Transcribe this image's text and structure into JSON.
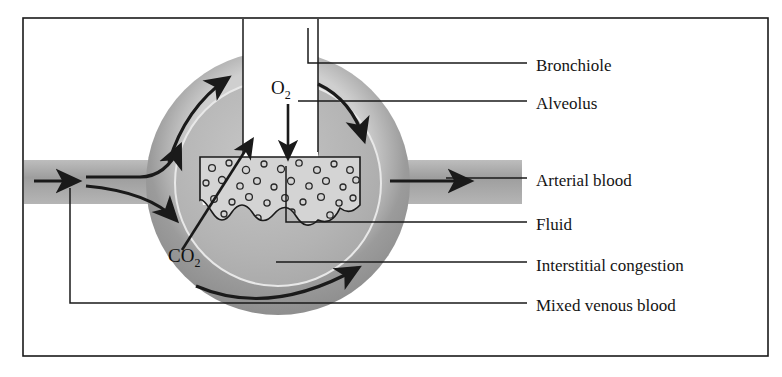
{
  "figure": {
    "kind": "alveolus-capillary-diagram",
    "frame": {
      "x": 23,
      "y": 18,
      "width": 745,
      "height": 338,
      "border_color": "#1a1a1a"
    },
    "background": "#ffffff"
  },
  "colors": {
    "capillary_ring": "#9b9b9b",
    "capillary_ring_dark": "#808080",
    "vessel": "#a6a6a6",
    "alveolus_interior": "#b4b4b4",
    "alveolus_lumen": "#ffffff",
    "fluid": "#d2d2d2",
    "ink": "#141414",
    "bronchiole": "#ffffff"
  },
  "gas_labels": [
    {
      "id": "o2",
      "text": "O",
      "subscript": "2",
      "x": 271,
      "y": 78,
      "arrow": "down"
    },
    {
      "id": "co2",
      "text": "CO",
      "subscript": "2",
      "x": 168,
      "y": 246,
      "arrow": "up-right"
    }
  ],
  "callouts": [
    {
      "id": "bronchiole",
      "label": "Bronchiole",
      "text_x": 536,
      "text_y": 57
    },
    {
      "id": "alveolus",
      "label": "Alveolus",
      "text_x": 536,
      "text_y": 95
    },
    {
      "id": "arterial-blood",
      "label": "Arterial blood",
      "text_x": 536,
      "text_y": 172
    },
    {
      "id": "fluid",
      "label": "Fluid",
      "text_x": 536,
      "text_y": 216
    },
    {
      "id": "interstitial-congestion",
      "label": "Interstitial congestion",
      "text_x": 536,
      "text_y": 257
    },
    {
      "id": "mixed-venous-blood",
      "label": "Mixed venous blood",
      "text_x": 536,
      "text_y": 297
    }
  ],
  "flow_arrows": [
    {
      "id": "inflow-left",
      "direction": "right",
      "meaning": "mixed venous blood entering"
    },
    {
      "id": "branch-upper",
      "direction": "up-right",
      "meaning": "blood into upper capillary"
    },
    {
      "id": "branch-lower",
      "direction": "down-right",
      "meaning": "blood into lower capillary"
    },
    {
      "id": "ring-upper-left",
      "direction": "up-right",
      "meaning": "capillary flow"
    },
    {
      "id": "ring-upper-right",
      "direction": "down-right",
      "meaning": "capillary flow"
    },
    {
      "id": "ring-bottom",
      "direction": "up-right",
      "meaning": "capillary flow"
    },
    {
      "id": "outflow-right",
      "direction": "right",
      "meaning": "arterial blood leaving"
    }
  ]
}
